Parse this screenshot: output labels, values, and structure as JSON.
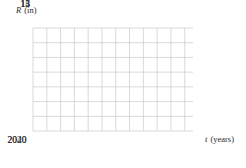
{
  "figure": {
    "background_color": "#ffffff",
    "grid_color": "#c9c9c9",
    "axis_color": "#8a8a8a",
    "curve_color": "#6b6b6b",
    "point_color": "#000000"
  },
  "axes": {
    "y_title_var": "R",
    "y_title_unit": "(in)",
    "x_title_var": "t",
    "x_title_unit": "(years)",
    "y_ticks": [
      15,
      14,
      13
    ],
    "x_ticks": [
      2020,
      2040
    ]
  },
  "chart_data": {
    "type": "line",
    "title": "",
    "xlabel": "t (years)",
    "ylabel": "R (in)",
    "xlim": [
      2005,
      2063
    ],
    "ylim": [
      12.25,
      15.75
    ],
    "grid": true,
    "grid_x_step": 5,
    "grid_y_step": 0.5,
    "legend": null,
    "x_tick_labels": [
      "2020",
      "2040"
    ],
    "y_tick_labels": [
      "15",
      "14",
      "13"
    ],
    "series": [
      {
        "name": "R(t)",
        "x": [
          2005,
          2008,
          2011,
          2014,
          2016,
          2018,
          2020,
          2022,
          2024,
          2026,
          2029,
          2032,
          2036,
          2040,
          2045,
          2050,
          2056,
          2063
        ],
        "y": [
          15.26,
          15.22,
          15.15,
          15.03,
          14.93,
          14.75,
          14.5,
          14.25,
          14.07,
          13.95,
          13.82,
          13.73,
          13.65,
          13.6,
          13.56,
          13.54,
          13.52,
          13.51
        ]
      }
    ],
    "annotations": [
      {
        "kind": "point-marker",
        "label": "",
        "x": 2020,
        "y": 14.5
      }
    ]
  }
}
